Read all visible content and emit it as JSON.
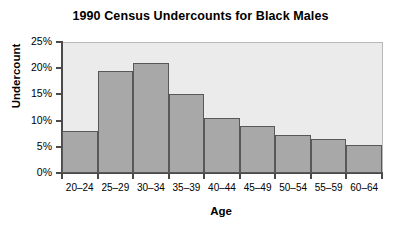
{
  "chart_data": {
    "type": "bar",
    "title": "1990 Census Undercounts for Black Males",
    "xlabel": "Age",
    "ylabel": "Undercount",
    "categories": [
      "20–24",
      "25–29",
      "30–34",
      "35–39",
      "40–44",
      "45–49",
      "50–54",
      "55–59",
      "60–64"
    ],
    "values": [
      8.0,
      19.5,
      21.0,
      15.1,
      10.5,
      9.0,
      7.3,
      6.5,
      5.3
    ],
    "ylim": [
      0,
      25
    ],
    "ytick_values": [
      0,
      5,
      10,
      15,
      20,
      25
    ],
    "ytick_labels": [
      "0%",
      "5%",
      "10%",
      "15%",
      "20%",
      "25%"
    ],
    "grid": false,
    "legend": null,
    "bar_gap": 0,
    "colors": {
      "bar_fill": "#a8a8a8",
      "bar_edge": "#58585a",
      "plot_background": "#ebebeb",
      "axis": "#4a4a4a",
      "text": "#000000",
      "figure_background": "#ffffff"
    }
  }
}
